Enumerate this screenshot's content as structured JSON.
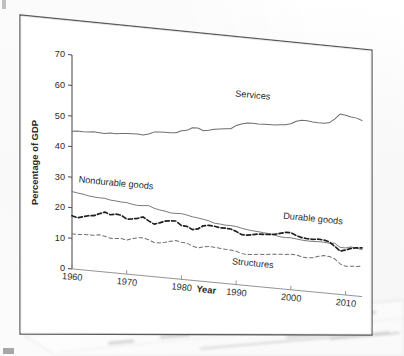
{
  "figure": {
    "kind": "scanned-textbook-figure",
    "page_background": "#fefefe",
    "ink_color": "#2b2b2b"
  },
  "chart_data": {
    "type": "line",
    "title": "",
    "xlabel": "Year",
    "ylabel": "Percentage of GDP",
    "xlim": [
      1960,
      2013
    ],
    "ylim": [
      0,
      70
    ],
    "xticks": [
      1960,
      1970,
      1980,
      1990,
      2000,
      2010
    ],
    "yticks": [
      0,
      10,
      20,
      30,
      40,
      50,
      60,
      70
    ],
    "grid": false,
    "legend": "inline-annotations",
    "annotations": [
      {
        "text": "Services",
        "x": 1993,
        "y": 61.5
      },
      {
        "text": "Nondurable goods",
        "x": 1968,
        "y": 28.5
      },
      {
        "text": "Durable goods",
        "x": 2004,
        "y": 23.0
      },
      {
        "text": "Structures",
        "x": 1993,
        "y": 6.5
      }
    ],
    "x": [
      1960,
      1961,
      1962,
      1963,
      1964,
      1965,
      1966,
      1967,
      1968,
      1969,
      1970,
      1971,
      1972,
      1973,
      1974,
      1975,
      1976,
      1977,
      1978,
      1979,
      1980,
      1981,
      1982,
      1983,
      1984,
      1985,
      1986,
      1987,
      1988,
      1989,
      1990,
      1991,
      1992,
      1993,
      1994,
      1995,
      1996,
      1997,
      1998,
      1999,
      2000,
      2001,
      2002,
      2003,
      2004,
      2005,
      2006,
      2007,
      2008,
      2009,
      2010,
      2011,
      2012,
      2013
    ],
    "series": [
      {
        "name": "Services",
        "style": "solid",
        "width": 1.0,
        "values": [
          45.0,
          45.3,
          45.2,
          45.3,
          45.5,
          45.4,
          45.3,
          45.6,
          45.6,
          45.8,
          46.0,
          46.1,
          46.2,
          46.0,
          46.5,
          47.3,
          47.5,
          47.6,
          47.6,
          47.8,
          48.6,
          48.9,
          49.9,
          50.0,
          49.3,
          49.6,
          50.1,
          50.4,
          50.6,
          50.8,
          52.0,
          52.7,
          53.2,
          53.3,
          53.2,
          53.3,
          53.4,
          53.4,
          53.6,
          53.8,
          54.3,
          55.3,
          55.8,
          55.8,
          55.6,
          55.5,
          55.5,
          55.8,
          57.2,
          59.0,
          58.8,
          58.4,
          58.2,
          57.6
        ]
      },
      {
        "name": "Nondurable goods",
        "style": "solid",
        "width": 0.9,
        "values": [
          25.3,
          25.0,
          24.8,
          24.4,
          24.2,
          24.1,
          24.1,
          23.7,
          23.6,
          23.4,
          23.4,
          23.0,
          22.8,
          22.9,
          23.1,
          22.4,
          22.0,
          21.8,
          21.4,
          21.4,
          21.5,
          21.2,
          20.8,
          20.6,
          20.3,
          20.0,
          19.4,
          19.3,
          19.1,
          19.1,
          19.0,
          18.6,
          18.3,
          18.1,
          18.0,
          17.8,
          17.7,
          17.4,
          17.0,
          16.9,
          17.0,
          16.8,
          16.6,
          16.5,
          16.5,
          16.6,
          16.6,
          16.4,
          16.6,
          15.4,
          15.4,
          15.9,
          15.6,
          15.4
        ]
      },
      {
        "name": "Durable goods",
        "style": "dashed-bold",
        "width": 1.7,
        "values": [
          17.4,
          16.9,
          17.4,
          17.9,
          18.1,
          18.9,
          19.6,
          18.9,
          19.3,
          19.1,
          18.0,
          18.2,
          18.6,
          19.2,
          18.1,
          17.2,
          17.8,
          18.5,
          18.8,
          18.9,
          17.6,
          17.5,
          16.6,
          17.0,
          18.2,
          18.5,
          18.4,
          18.1,
          18.1,
          18.0,
          17.4,
          16.5,
          16.5,
          16.8,
          17.2,
          17.3,
          17.4,
          17.6,
          18.1,
          18.6,
          18.7,
          17.9,
          17.4,
          17.2,
          17.2,
          17.4,
          17.3,
          16.9,
          15.6,
          14.2,
          14.7,
          15.4,
          15.8,
          15.9
        ]
      },
      {
        "name": "Structures",
        "style": "dashed-thin",
        "width": 1.0,
        "values": [
          11.5,
          11.4,
          11.6,
          11.7,
          11.7,
          12.0,
          11.7,
          11.2,
          11.3,
          11.5,
          11.1,
          11.8,
          12.2,
          12.4,
          11.9,
          11.2,
          11.2,
          11.6,
          12.1,
          12.5,
          12.1,
          12.0,
          11.2,
          10.8,
          11.3,
          11.6,
          11.5,
          11.4,
          11.2,
          11.1,
          10.9,
          10.3,
          10.2,
          10.3,
          10.6,
          10.7,
          10.9,
          11.1,
          11.3,
          11.4,
          11.6,
          11.6,
          11.1,
          11.0,
          11.2,
          11.8,
          12.2,
          12.1,
          11.5,
          10.0,
          9.4,
          9.6,
          9.7,
          9.9
        ]
      }
    ]
  }
}
